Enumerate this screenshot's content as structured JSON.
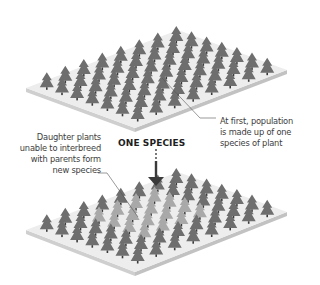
{
  "title": "ONE SPECIES",
  "annotations": {
    "top": {
      "lines": [
        "At first, population",
        "is made up of one",
        "species of plant"
      ]
    },
    "bottom": {
      "lines": [
        "Daughter plants",
        "unable to interbreed",
        "with parents form",
        "new species"
      ]
    }
  },
  "colors": {
    "platform_top": "#ededed",
    "platform_side": "#cfcfcf",
    "platform_edge": "#b9b9b9",
    "tree_original": "#6e6e6e",
    "tree_new_species": "#a9a9a9",
    "arrow": "#3a3a3a",
    "leader_line": "#555555"
  },
  "panels": [
    {
      "name": "before",
      "description": "platform of trees, all one species"
    },
    {
      "name": "after",
      "description": "platform of trees, a block of lighter daughter species among original"
    }
  ]
}
